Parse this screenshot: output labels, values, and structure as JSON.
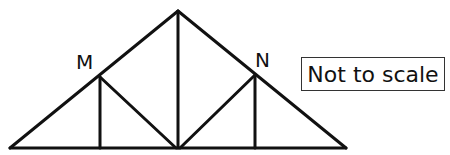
{
  "diagram": {
    "type": "roof-truss",
    "labels": {
      "left_point": "M",
      "right_point": "N"
    },
    "note": "Not to scale",
    "members": [
      "left-rafter",
      "right-rafter",
      "base-chord",
      "king-post",
      "left-vertical-from-M",
      "left-diagonal-M-to-center",
      "right-vertical-from-N",
      "right-diagonal-center-to-N"
    ],
    "line_color": "#111111"
  }
}
